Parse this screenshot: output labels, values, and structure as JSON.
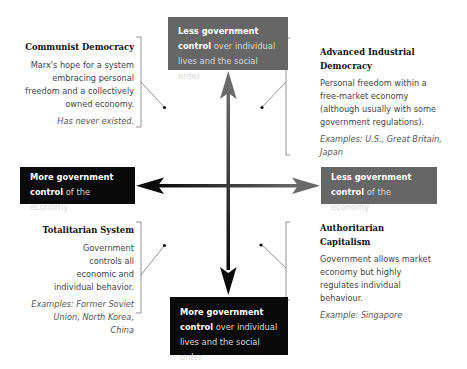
{
  "diagram": {
    "type": "quadrant",
    "axes": {
      "vertical": {
        "top": {
          "bold": "Less government control",
          "rest": "over individual lives and the social order",
          "color": "#666666"
        },
        "bottom": {
          "bold": "More government control",
          "rest": "over individual lives and the social order",
          "color": "#0a0a0a"
        }
      },
      "horizontal": {
        "left": {
          "bold": "More government control",
          "rest": "of the economy",
          "color": "#0a0a0a"
        },
        "right": {
          "bold": "Less government control",
          "rest": "of the economy",
          "color": "#666666"
        }
      }
    },
    "quadrants": {
      "top_left": {
        "title": "Communist Democracy",
        "body": "Marx's hope for a system embracing personal freedom and a collectively owned economy.",
        "example_prefix": "Has",
        "example_em": "never",
        "example_suffix": "existed."
      },
      "top_right": {
        "title": "Advanced Industrial Democracy",
        "body": "Personal freedom within a free-market economy (although usually with some government regulations).",
        "example_label": "Examples:",
        "example": "U.S., Great Britain, Japan"
      },
      "bottom_left": {
        "title": "Totalitarian System",
        "body": "Government controls all economic and individual behavior.",
        "example_label": "Examples:",
        "example": "Former Soviet Union, North Korea, China"
      },
      "bottom_right": {
        "title": "Authoritarian Capitalism",
        "body": "Government allows market economy but highly regulates individual behaviour.",
        "example_label": "Example:",
        "example": "Singapore"
      }
    }
  }
}
